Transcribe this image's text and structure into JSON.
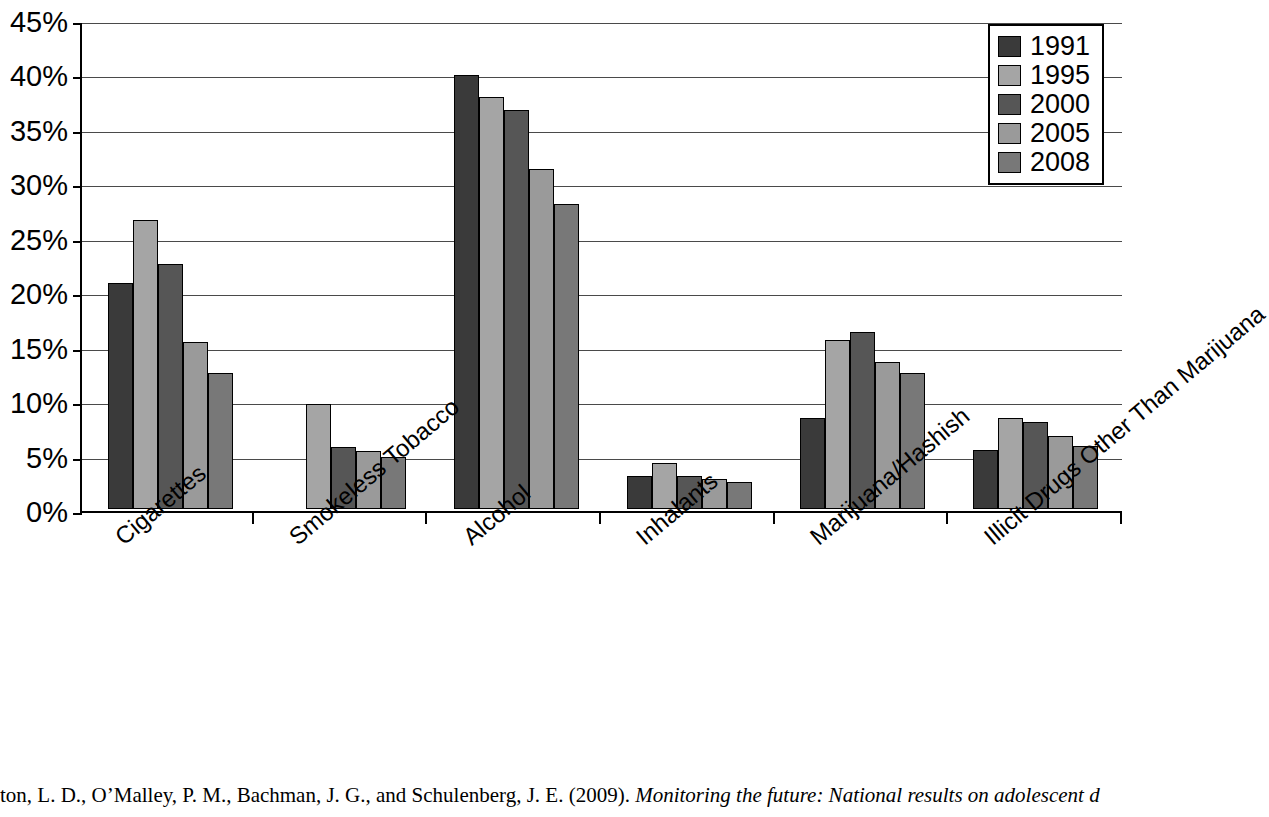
{
  "chart_data": {
    "type": "bar",
    "title": "",
    "subtitle": "",
    "xlabel": "",
    "ylabel": "",
    "ylim": [
      0,
      45
    ],
    "ytick_labels": [
      "0%",
      "5%",
      "10%",
      "15%",
      "20%",
      "25%",
      "30%",
      "35%",
      "40%",
      "45%"
    ],
    "ytick_values": [
      0,
      5,
      10,
      15,
      20,
      25,
      30,
      35,
      40,
      45
    ],
    "grid": "horizontal",
    "legend_position": "top-right",
    "categories": [
      "Cigarettes",
      "Smokeless Tobacco",
      "Alcohol",
      "Inhalants",
      "Marijuana/Hashish",
      "Illicit Drugs Other Than Marijuana"
    ],
    "series": [
      {
        "name": "1991",
        "color": "#3a3a3a",
        "values": [
          20.8,
          null,
          39.9,
          3.0,
          8.4,
          5.4
        ]
      },
      {
        "name": "1995",
        "color": "#a5a5a5",
        "values": [
          26.5,
          9.6,
          37.8,
          4.2,
          15.5,
          8.4
        ]
      },
      {
        "name": "2000",
        "color": "#565656",
        "values": [
          22.5,
          5.7,
          36.6,
          3.0,
          16.3,
          8.0
        ]
      },
      {
        "name": "2005",
        "color": "#9a9a9a",
        "values": [
          15.3,
          5.3,
          31.2,
          2.8,
          13.5,
          6.7
        ]
      },
      {
        "name": "2008",
        "color": "#787878",
        "values": [
          12.5,
          4.8,
          28.0,
          2.5,
          12.5,
          5.8
        ]
      }
    ]
  },
  "legend": {
    "entries": [
      {
        "label": "1991",
        "color": "#3a3a3a"
      },
      {
        "label": "1995",
        "color": "#a5a5a5"
      },
      {
        "label": "2000",
        "color": "#565656"
      },
      {
        "label": "2005",
        "color": "#9a9a9a"
      },
      {
        "label": "2008",
        "color": "#787878"
      }
    ]
  },
  "citation": {
    "prefix": "ton, L. D., O’Malley, P. M., Bachman, J. G., and Schulenberg, J. E. (2009). ",
    "italic": "Monitoring the future: National results on adolescent d"
  }
}
